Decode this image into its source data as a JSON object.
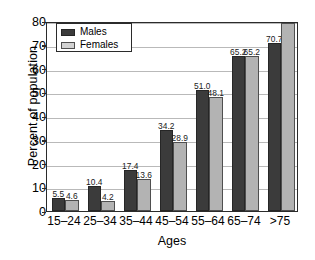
{
  "chart_data": {
    "type": "bar",
    "title": "",
    "xlabel": "Ages",
    "ylabel": "Percent of population",
    "categories": [
      "15–24",
      "25–34",
      "35–44",
      "45–54",
      "55–64",
      "65–74",
      ">75"
    ],
    "series": [
      {
        "name": "Males",
        "color": "#3b3b3b",
        "values": [
          5.5,
          10.4,
          17.4,
          34.2,
          51.0,
          65.2,
          70.7
        ]
      },
      {
        "name": "Females",
        "color": "#b3b3b3",
        "values": [
          4.6,
          4.2,
          13.6,
          28.9,
          48.1,
          65.2,
          79.0
        ]
      }
    ],
    "value_labels": [
      [
        "5.5",
        "4.6"
      ],
      [
        "10.4",
        "4.2"
      ],
      [
        "17.4",
        "13.6"
      ],
      [
        "34.2",
        "28.9"
      ],
      [
        "51.0",
        "48.1"
      ],
      [
        "65.2",
        "65.2"
      ],
      [
        "70.7",
        "79.0"
      ]
    ],
    "ylim": [
      0,
      80
    ],
    "yticks": [
      0,
      10,
      20,
      30,
      40,
      50,
      60,
      70,
      80
    ],
    "ytick_labels": [
      "0",
      "10",
      "20",
      "30",
      "40",
      "50",
      "60",
      "70",
      "80"
    ],
    "grid": true,
    "legend_position": "top-left",
    "legend_entries": [
      "Males",
      "Females"
    ]
  }
}
